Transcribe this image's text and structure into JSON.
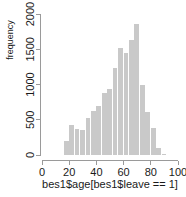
{
  "chart_data": {
    "type": "bar",
    "title": "",
    "subtitle": "",
    "xlabel": "bes1$age[bes1$leave == 1]",
    "ylabel": "frequency",
    "xlim": [
      0,
      100
    ],
    "ylim": [
      0,
      2000
    ],
    "grid": false,
    "legend": null,
    "bar_color": "#c9c9c9",
    "axis_color": "#9a9a9a",
    "bin_width": 4,
    "xticks": [
      0,
      20,
      40,
      60,
      80,
      100
    ],
    "xtick_labels": [
      "0",
      "20",
      "40",
      "60",
      "80",
      "100"
    ],
    "yticks": [
      0,
      500,
      1000,
      1500,
      2000
    ],
    "ytick_labels": [
      "0",
      "500",
      "1000",
      "1500",
      "2000"
    ],
    "bins": [
      {
        "x0": 16,
        "x1": 20,
        "center": 18,
        "value": 200
      },
      {
        "x0": 20,
        "x1": 24,
        "center": 22,
        "value": 420
      },
      {
        "x0": 24,
        "x1": 28,
        "center": 26,
        "value": 370
      },
      {
        "x0": 28,
        "x1": 32,
        "center": 30,
        "value": 350
      },
      {
        "x0": 32,
        "x1": 36,
        "center": 34,
        "value": 530
      },
      {
        "x0": 36,
        "x1": 40,
        "center": 38,
        "value": 620
      },
      {
        "x0": 40,
        "x1": 44,
        "center": 42,
        "value": 690
      },
      {
        "x0": 44,
        "x1": 48,
        "center": 46,
        "value": 880
      },
      {
        "x0": 48,
        "x1": 52,
        "center": 50,
        "value": 940
      },
      {
        "x0": 52,
        "x1": 56,
        "center": 54,
        "value": 1240
      },
      {
        "x0": 56,
        "x1": 60,
        "center": 58,
        "value": 1520
      },
      {
        "x0": 60,
        "x1": 64,
        "center": 62,
        "value": 1450
      },
      {
        "x0": 64,
        "x1": 68,
        "center": 66,
        "value": 1630
      },
      {
        "x0": 68,
        "x1": 72,
        "center": 70,
        "value": 1860
      },
      {
        "x0": 72,
        "x1": 76,
        "center": 74,
        "value": 990
      },
      {
        "x0": 76,
        "x1": 80,
        "center": 78,
        "value": 610
      },
      {
        "x0": 80,
        "x1": 84,
        "center": 82,
        "value": 380
      },
      {
        "x0": 84,
        "x1": 88,
        "center": 86,
        "value": 105
      },
      {
        "x0": 88,
        "x1": 92,
        "center": 90,
        "value": 20
      }
    ]
  }
}
